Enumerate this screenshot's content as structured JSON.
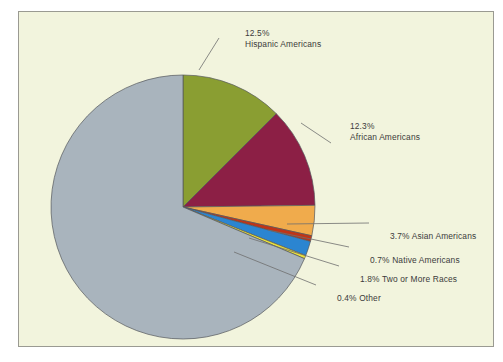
{
  "frame": {
    "background_color": "#f2f4dd",
    "border_color": "#9a9a92"
  },
  "chart_data": {
    "type": "pie",
    "title": "",
    "subtitle": "",
    "xlabel": "",
    "ylabel": "",
    "legend_position": "none",
    "grid": false,
    "unit": "%",
    "start_angle_deg": 0,
    "direction": "clockwise",
    "center": {
      "x": 182,
      "y": 206
    },
    "radius": 132,
    "categories": [
      "Hispanic Americans",
      "African Americans",
      "Asian Americans",
      "Native Americans",
      "Two or More Races",
      "Other",
      "White Americans"
    ],
    "values": [
      12.5,
      12.3,
      3.7,
      0.7,
      1.8,
      0.4,
      68.6
    ],
    "colors": [
      "#8a9e32",
      "#8c1f45",
      "#f0ab4c",
      "#bf3417",
      "#2b85d1",
      "#ebe23a",
      "#a9b4bd"
    ],
    "slices": [
      {
        "label": "Hispanic Americans",
        "value": 12.5,
        "display": "12.5%",
        "color": "#8a9e32",
        "labeled": true
      },
      {
        "label": "African Americans",
        "value": 12.3,
        "display": "12.3%",
        "color": "#8c1f45",
        "labeled": true
      },
      {
        "label": "Asian Americans",
        "value": 3.7,
        "display": "3.7%",
        "color": "#f0ab4c",
        "labeled": true
      },
      {
        "label": "Native Americans",
        "value": 0.7,
        "display": "0.7%",
        "color": "#bf3417",
        "labeled": true
      },
      {
        "label": "Two or More Races",
        "value": 1.8,
        "display": "1.8%",
        "color": "#2b85d1",
        "labeled": true
      },
      {
        "label": "Other",
        "value": 0.4,
        "display": "0.4%",
        "color": "#ebe23a",
        "labeled": true
      },
      {
        "label": "White Americans",
        "value": 68.6,
        "display": "",
        "color": "#a9b4bd",
        "labeled": false
      }
    ]
  },
  "labels": {
    "hispanic": {
      "percent": "12.5%",
      "name": "Hispanic Americans"
    },
    "african": {
      "percent": "12.3%",
      "name": "African Americans"
    },
    "asian": {
      "text": "3.7% Asian Americans"
    },
    "native": {
      "text": "0.7% Native Americans"
    },
    "two_or_more": {
      "text": "1.8% Two or More Races"
    },
    "other": {
      "text": "0.4% Other"
    }
  }
}
